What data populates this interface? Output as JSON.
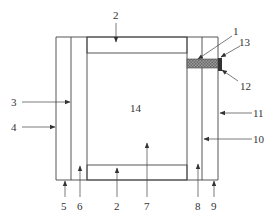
{
  "diagram": {
    "type": "cross-section schematic",
    "colors": {
      "line": "#444444",
      "hatch": "#666666",
      "block_fill": "#888888",
      "tab_fill": "#333333",
      "text": "#333333"
    },
    "labels": {
      "l1": "1",
      "l2_top": "2",
      "l2_bottom": "2",
      "l3": "3",
      "l4": "4",
      "l5": "5",
      "l6": "6",
      "l7": "7",
      "l8": "8",
      "l9": "9",
      "l10": "10",
      "l11": "11",
      "l12": "12",
      "l13": "13",
      "l14": "14"
    },
    "parts": [
      {
        "id": "1",
        "desc": "horizontal cross-hatched bar on right side"
      },
      {
        "id": "2",
        "desc": "diagonal-hatched top and bottom plates"
      },
      {
        "id": "3",
        "desc": "inner left wall line"
      },
      {
        "id": "4",
        "desc": "outer left wall line"
      },
      {
        "id": "5",
        "desc": "bottom of outer left column"
      },
      {
        "id": "6",
        "desc": "inner left column"
      },
      {
        "id": "7",
        "desc": "central chamber"
      },
      {
        "id": "8",
        "desc": "inner right column"
      },
      {
        "id": "9",
        "desc": "bottom of outer right column"
      },
      {
        "id": "10",
        "desc": "inner right wall line"
      },
      {
        "id": "11",
        "desc": "outer right wall line"
      },
      {
        "id": "12",
        "desc": "dark end tab"
      },
      {
        "id": "13",
        "desc": "top of dark end tab"
      },
      {
        "id": "14",
        "desc": "central region label"
      }
    ]
  }
}
